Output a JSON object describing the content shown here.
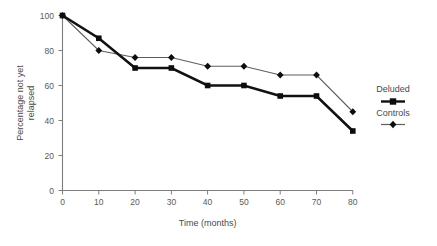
{
  "chart_data": {
    "type": "line",
    "title": "",
    "subtitle": "",
    "xlabel": "Time (months)",
    "ylabel": "Percentage not yet relapsed",
    "ylabel_line1": "Percentage not yet",
    "ylabel_line2": "relapsed",
    "x": [
      0,
      10,
      20,
      30,
      40,
      50,
      60,
      70,
      80
    ],
    "xlim": [
      0,
      80
    ],
    "ylim": [
      0,
      100
    ],
    "xticks": [
      "0",
      "10",
      "20",
      "30",
      "40",
      "50",
      "60",
      "70",
      "80"
    ],
    "yticks": [
      "0",
      "20",
      "40",
      "60",
      "80",
      "100"
    ],
    "grid": false,
    "legend_position": "right",
    "series": [
      {
        "name": "Deluded",
        "values": [
          100,
          87,
          70,
          70,
          60,
          60,
          54,
          54,
          34
        ],
        "marker": "square",
        "line_weight": "thick",
        "color": "#111111"
      },
      {
        "name": "Controls",
        "values": [
          100,
          80,
          76,
          76,
          71,
          71,
          66,
          66,
          45
        ],
        "marker": "diamond",
        "line_weight": "thin",
        "color": "#5d5d5d"
      }
    ]
  },
  "legend": {
    "entries": [
      {
        "label": "Deluded"
      },
      {
        "label": "Controls"
      }
    ]
  },
  "axes": {
    "x_title": "Time (months)",
    "y_title_line1": "Percentage not yet",
    "y_title_line2": "relapsed",
    "x_tick_labels": [
      "0",
      "10",
      "20",
      "30",
      "40",
      "50",
      "60",
      "70",
      "80"
    ],
    "y_tick_labels": [
      "0",
      "20",
      "40",
      "60",
      "80",
      "100"
    ]
  },
  "colors": {
    "axis": "#7d7d7d",
    "series_deluded": "#111111",
    "series_controls": "#5d5d5d",
    "text": "#4a4a4a",
    "background": "#ffffff"
  }
}
